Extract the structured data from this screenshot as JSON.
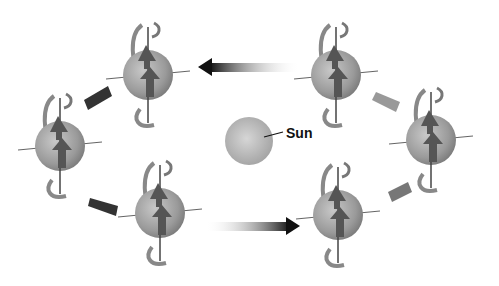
{
  "diagram": {
    "sun": {
      "label": "Sun",
      "cx": 249,
      "cy": 141,
      "r": 24
    },
    "planets": [
      {
        "id": "top-left",
        "cx": 148,
        "cy": 75
      },
      {
        "id": "top-right",
        "cx": 336,
        "cy": 75
      },
      {
        "id": "left",
        "cx": 60,
        "cy": 146
      },
      {
        "id": "right",
        "cx": 431,
        "cy": 140
      },
      {
        "id": "bottom-left",
        "cx": 160,
        "cy": 213
      },
      {
        "id": "bottom-right",
        "cx": 338,
        "cy": 215
      }
    ],
    "colors": {
      "sphere": "#9a9a9a",
      "arrow_dark": "#111111",
      "axis": "#555555"
    }
  }
}
